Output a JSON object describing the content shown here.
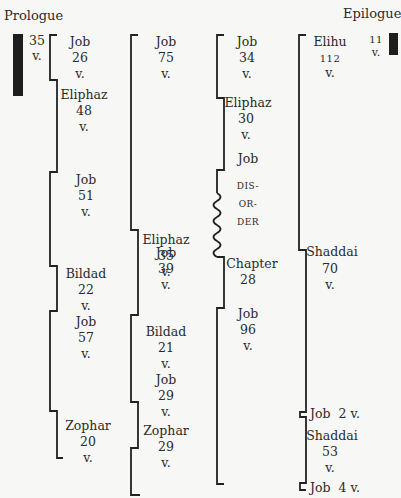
{
  "headers": {
    "prologue": "Prologue",
    "epilogue": "Epilogue"
  },
  "prologue": {
    "count": "35",
    "unit": "v."
  },
  "epilogue": {
    "count": "11",
    "unit": "v."
  },
  "columns": [
    {
      "segments": [
        {
          "speaker": "Job",
          "count": "26",
          "unit": "v."
        },
        {
          "speaker": "Eliphaz",
          "count": "48",
          "unit": "v."
        },
        {
          "speaker": "Job",
          "count": "51",
          "unit": "v."
        },
        {
          "speaker": "Bildad",
          "count": "22",
          "unit": "v."
        },
        {
          "speaker": "Job",
          "count": "57",
          "unit": "v."
        },
        {
          "speaker": "Zophar",
          "count": "20",
          "unit": "v."
        }
      ]
    },
    {
      "segments": [
        {
          "speaker": "Job",
          "count": "75",
          "unit": "v."
        },
        {
          "speaker": "Eliphaz",
          "count": "35",
          "unit": "v."
        },
        {
          "speaker": "Job",
          "count": "39",
          "unit": "v."
        },
        {
          "speaker": "Bildad",
          "count": "21",
          "unit": "v."
        },
        {
          "speaker": "Job",
          "count": "29",
          "unit": "v."
        },
        {
          "speaker": "Zophar",
          "count": "29",
          "unit": "v."
        }
      ]
    },
    {
      "segments": [
        {
          "speaker": "Job",
          "count": "34",
          "unit": "v."
        },
        {
          "speaker": "Eliphaz",
          "count": "30",
          "unit": "v."
        },
        {
          "speaker": "Job",
          "disorder": [
            "DIS-",
            "OR-",
            "DER"
          ]
        },
        {
          "speaker": "Chapter",
          "count": "28"
        },
        {
          "speaker": "Job",
          "count": "96",
          "unit": "v."
        }
      ]
    },
    {
      "segments": [
        {
          "speaker": "Elihu",
          "count": "112",
          "unit": "v."
        },
        {
          "speaker": "Shaddai",
          "count": "70",
          "unit": "v."
        },
        {
          "speaker": "Job",
          "inline": "Job  2 v."
        },
        {
          "speaker": "Shaddai",
          "count": "53",
          "unit": "v."
        },
        {
          "speaker": "Job",
          "inline": "Job  4 v."
        }
      ]
    }
  ]
}
